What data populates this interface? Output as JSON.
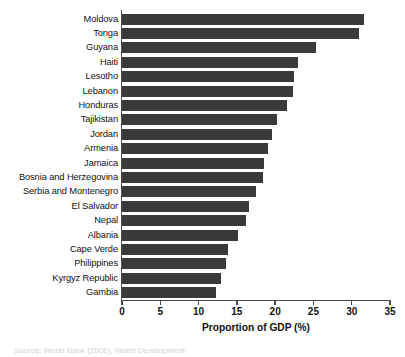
{
  "chart_data": {
    "type": "bar",
    "orientation": "horizontal",
    "title": "",
    "xlabel": "Proportion of GDP (%)",
    "ylabel": "",
    "xlim": [
      0,
      35
    ],
    "xticks": [
      0,
      5,
      10,
      15,
      20,
      25,
      30,
      35
    ],
    "grid": false,
    "legend": null,
    "bar_color": "#3a3a3a",
    "axis_color": "#4a4a4a",
    "categories": [
      "Moldova",
      "Tonga",
      "Guyana",
      "Haiti",
      "Lesotho",
      "Lebanon",
      "Honduras",
      "Tajikistan",
      "Jordan",
      "Armenia",
      "Jamaica",
      "Bosnia and Herzegovina",
      "Serbia and Montenegro",
      "El Salvador",
      "Nepal",
      "Albania",
      "Cape Verde",
      "Philippines",
      "Kyrgyz Republic",
      "Gambia"
    ],
    "values": [
      31.6,
      30.9,
      25.4,
      23.0,
      22.5,
      22.3,
      21.5,
      20.3,
      19.6,
      19.1,
      18.5,
      18.4,
      17.5,
      16.6,
      16.2,
      15.2,
      13.8,
      13.6,
      12.9,
      12.3
    ]
  },
  "caption": {
    "text": "Source: World Bank (2006), World Development"
  }
}
